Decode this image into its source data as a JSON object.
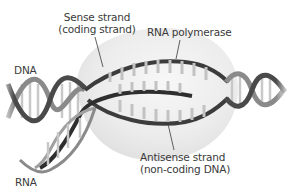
{
  "diagram": {
    "type": "transcription-bubble",
    "labels": {
      "sense_line1": "Sense strand",
      "sense_line2": "(coding strand)",
      "polymerase": "RNA polymerase",
      "dna": "DNA",
      "rna": "RNA",
      "antisense_line1": "Antisense strand",
      "antisense_line2": "(non-coding DNA)"
    },
    "colors": {
      "strand_dark": "#3c3c3c",
      "strand_mid": "#8a8a8a",
      "base_pair": "#c4c4c4",
      "bubble": "#ebebeb",
      "text": "#3a3a3a"
    }
  }
}
